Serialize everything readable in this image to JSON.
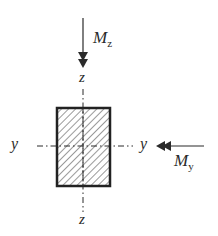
{
  "figure": {
    "type": "rectangular cross-section under biaxial bending",
    "labels": {
      "moment_z": {
        "main": "M",
        "sub": "z"
      },
      "moment_y": {
        "main": "M",
        "sub": "y"
      },
      "z_axis_top": "z",
      "z_axis_bottom": "z",
      "y_axis_left": "y",
      "y_axis_right": "y"
    },
    "section": {
      "shape": "rectangle",
      "fill": "hatched"
    },
    "colors": {
      "stroke": "#2a2a2a",
      "hatch": "#555555",
      "background": "#ffffff"
    }
  }
}
